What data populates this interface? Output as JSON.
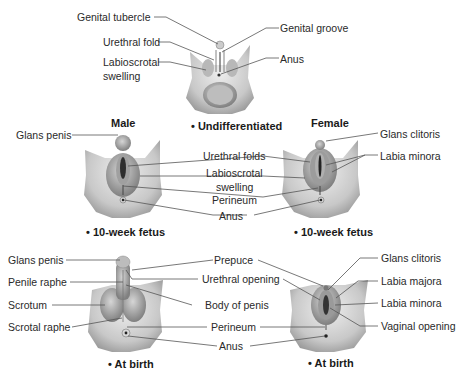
{
  "figure": {
    "undifferentiated": {
      "caption": "• Undifferentiated",
      "labels": {
        "genital_tubercle": "Genital tubercle",
        "urethral_fold": "Urethral fold",
        "labioscrotal_swelling_1": "Labioscrotal",
        "labioscrotal_swelling_2": "swelling",
        "genital_groove": "Genital groove",
        "anus": "Anus"
      }
    },
    "fetus_10_week": {
      "male_heading": "Male",
      "female_heading": "Female",
      "male_caption": "• 10-week fetus",
      "female_caption": "• 10-week fetus",
      "labels": {
        "glans_penis": "Glans penis",
        "urethral_folds": "Urethral folds",
        "labioscrotal_swelling_1": "Labioscrotal",
        "labioscrotal_swelling_2": "swelling",
        "perineum": "Perineum",
        "anus": "Anus",
        "glans_clitoris": "Glans clitoris",
        "labia_minora": "Labia minora"
      }
    },
    "at_birth": {
      "male_caption": "• At birth",
      "female_caption": "• At birth",
      "labels": {
        "glans_penis": "Glans penis",
        "penile_raphe": "Penile raphe",
        "scrotum": "Scrotum",
        "scrotal_raphe": "Scrotal raphe",
        "prepuce": "Prepuce",
        "urethral_opening": "Urethral opening",
        "body_of_penis": "Body of penis",
        "perineum": "Perineum",
        "anus": "Anus",
        "glans_clitoris": "Glans clitoris",
        "labia_majora": "Labia majora",
        "labia_minora": "Labia minora",
        "vaginal_opening": "Vaginal opening"
      }
    }
  }
}
